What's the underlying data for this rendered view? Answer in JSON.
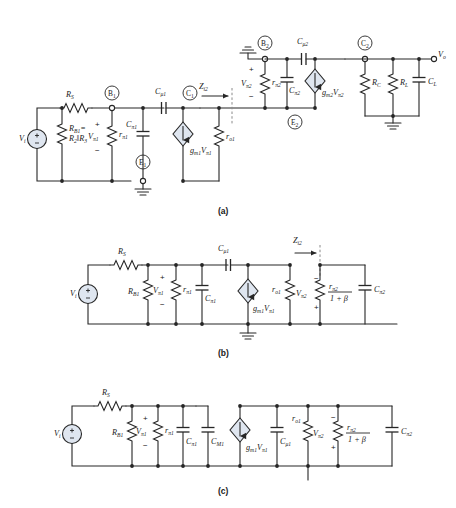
{
  "figure": {
    "title_partial": "",
    "panels": [
      {
        "id": "a",
        "label": "(a)"
      },
      {
        "id": "b",
        "label": "(b)"
      },
      {
        "id": "c",
        "label": "(c)"
      }
    ]
  },
  "panel_a": {
    "source_label": "V",
    "source_sub": "i",
    "source_plus": "+",
    "source_minus": "−",
    "rs": {
      "name": "R",
      "sub": "S"
    },
    "rb1_line1": {
      "name": "R",
      "sub": "B1",
      "eq": "="
    },
    "rb1_line2": {
      "name": "R",
      "sub": "2",
      "par": "‖",
      "name2": "R",
      "sub2": "3"
    },
    "vpi1": {
      "name": "V",
      "sub": "π1"
    },
    "rpi1": {
      "name": "r",
      "sub": "π1"
    },
    "cpi1": {
      "name": "C",
      "sub": "π1"
    },
    "cmu1": {
      "name": "C",
      "sub": "μ1"
    },
    "ro1": {
      "name": "r",
      "sub": "o1"
    },
    "gm1": {
      "name": "g",
      "sub": "m1",
      "v": "V",
      "vsub": "π1"
    },
    "zi2": {
      "name": "Z",
      "sub": "i2"
    },
    "vpi2": {
      "name": "V",
      "sub": "π2"
    },
    "rpi2": {
      "name": "r",
      "sub": "π2"
    },
    "cpi2": {
      "name": "C",
      "sub": "π2"
    },
    "cmu2": {
      "name": "C",
      "sub": "μ2"
    },
    "gm2": {
      "name": "g",
      "sub": "m2",
      "v": "V",
      "vsub": "π2"
    },
    "rc": {
      "name": "R",
      "sub": "C"
    },
    "rl": {
      "name": "R",
      "sub": "L"
    },
    "cl": {
      "name": "C",
      "sub": "L"
    },
    "vo": {
      "name": "V",
      "sub": "o"
    },
    "nodes": [
      {
        "name": "B",
        "sub": "1"
      },
      {
        "name": "C",
        "sub": "1"
      },
      {
        "name": "E",
        "sub": "1"
      },
      {
        "name": "B",
        "sub": "2"
      },
      {
        "name": "E",
        "sub": "2"
      },
      {
        "name": "C",
        "sub": "2"
      }
    ]
  },
  "panel_b": {
    "source_label": "V",
    "source_sub": "i",
    "source_plus": "+",
    "source_minus": "−",
    "rs": {
      "name": "R",
      "sub": "S"
    },
    "rb1": {
      "name": "R",
      "sub": "B1"
    },
    "vpi1": {
      "name": "V",
      "sub": "π1"
    },
    "rpi1": {
      "name": "r",
      "sub": "π1"
    },
    "cpi1": {
      "name": "C",
      "sub": "π1"
    },
    "cmu1": {
      "name": "C",
      "sub": "μ1"
    },
    "gm1": {
      "name": "g",
      "sub": "m1",
      "v": "V",
      "vsub": "π1"
    },
    "ro1": {
      "name": "r",
      "sub": "o1"
    },
    "zi2": {
      "name": "Z",
      "sub": "i2"
    },
    "vpi2": {
      "name": "V",
      "sub": "π2"
    },
    "frac_num": {
      "name": "r",
      "sub": "π2"
    },
    "frac_den": "1 + β",
    "cpi2": {
      "name": "C",
      "sub": "π2"
    }
  },
  "panel_c": {
    "source_label": "V",
    "source_sub": "i",
    "source_plus": "+",
    "source_minus": "−",
    "rs": {
      "name": "R",
      "sub": "S"
    },
    "rb1": {
      "name": "R",
      "sub": "B1"
    },
    "vpi1": {
      "name": "V",
      "sub": "π1"
    },
    "rpi1": {
      "name": "r",
      "sub": "π1"
    },
    "cpi1": {
      "name": "C",
      "sub": "π1"
    },
    "cm1": {
      "name": "C",
      "sub": "M1"
    },
    "gm1": {
      "name": "g",
      "sub": "m1",
      "v": "V",
      "vsub": "π1"
    },
    "cmu1": {
      "name": "C",
      "sub": "μ1"
    },
    "ro1": {
      "name": "r",
      "sub": "o1"
    },
    "vpi2": {
      "name": "V",
      "sub": "π2"
    },
    "frac_num": {
      "name": "r",
      "sub": "π2"
    },
    "frac_den": "1 + β",
    "cpi2": {
      "name": "C",
      "sub": "π2"
    }
  },
  "colors": {
    "wire": "#262626",
    "source_fill": "#dfe6f0",
    "dashed": "#8a8a8a",
    "background": "#ffffff"
  }
}
